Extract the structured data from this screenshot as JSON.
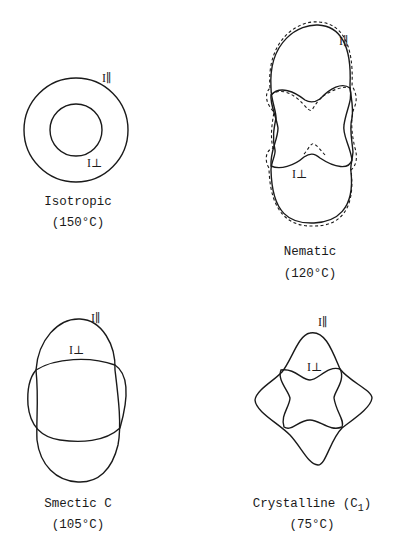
{
  "figure": {
    "panels": [
      {
        "name": "isotropic",
        "title": "Isotropic",
        "temperature": "(150°C)",
        "label_parallel": "I∥",
        "label_perp": "I⊥"
      },
      {
        "name": "nematic",
        "title": "Nematic",
        "temperature": "(120°C)",
        "label_parallel": "I∥",
        "label_perp": "I⊥"
      },
      {
        "name": "smectic-c",
        "title": "Smectic C",
        "temperature": "(105°C)",
        "label_parallel": "I∥",
        "label_perp": "I⊥"
      },
      {
        "name": "crystalline",
        "title": "Crystalline (C",
        "title_sub": "1",
        "title_end": ")",
        "temperature": "(75°C)",
        "label_parallel": "I∥",
        "label_perp": "I⊥"
      }
    ]
  }
}
